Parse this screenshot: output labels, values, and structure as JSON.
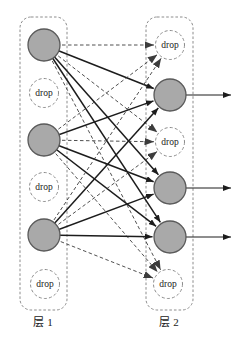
{
  "diagram": {
    "type": "neural-network-dropout-figure",
    "canvas": {
      "width": 238,
      "height": 344,
      "background": "#ffffff"
    },
    "colors": {
      "active_fill": "#a9a9a9",
      "active_stroke": "#5a5a5a",
      "drop_fill": "#ffffff",
      "drop_stroke": "#8c8c8c",
      "panel_stroke": "#8c8c8c",
      "edge_solid": "#1c1c1c",
      "edge_dashed": "#3c3c3c",
      "output_arrow": "#1c1c1c",
      "text": "#1a1a1a"
    },
    "drop_label": "drop",
    "layers": [
      {
        "id": "layer1",
        "label": "层 1",
        "label_pos": {
          "x": 43,
          "y": 326
        },
        "box": {
          "x": 20,
          "y": 17,
          "w": 47,
          "h": 293,
          "r": 11
        },
        "nodes": [
          {
            "id": "L1",
            "kind": "active",
            "cx": 44,
            "cy": 45,
            "r": 16
          },
          {
            "id": "L2",
            "kind": "drop",
            "cx": 44,
            "cy": 93,
            "r": 14.5
          },
          {
            "id": "L3",
            "kind": "active",
            "cx": 44,
            "cy": 140,
            "r": 16
          },
          {
            "id": "L4",
            "kind": "drop",
            "cx": 44,
            "cy": 187,
            "r": 14.5
          },
          {
            "id": "L5",
            "kind": "active",
            "cx": 44,
            "cy": 235,
            "r": 16
          },
          {
            "id": "L6",
            "kind": "drop",
            "cx": 45,
            "cy": 284,
            "r": 14.5
          }
        ]
      },
      {
        "id": "layer2",
        "label": "层 2",
        "label_pos": {
          "x": 169,
          "y": 326
        },
        "box": {
          "x": 146,
          "y": 17,
          "w": 47,
          "h": 293,
          "r": 11
        },
        "nodes": [
          {
            "id": "R1",
            "kind": "drop",
            "cx": 170,
            "cy": 45,
            "r": 14.5
          },
          {
            "id": "R2",
            "kind": "active",
            "cx": 170,
            "cy": 95,
            "r": 16
          },
          {
            "id": "R3",
            "kind": "drop",
            "cx": 170,
            "cy": 142,
            "r": 14.5
          },
          {
            "id": "R4",
            "kind": "active",
            "cx": 170,
            "cy": 188,
            "r": 16
          },
          {
            "id": "R5",
            "kind": "active",
            "cx": 170,
            "cy": 237,
            "r": 16
          },
          {
            "id": "R6",
            "kind": "drop",
            "cx": 168,
            "cy": 284,
            "r": 14.5
          }
        ]
      }
    ],
    "edges": [
      {
        "from": "L1",
        "to": "R1",
        "style": "dashed"
      },
      {
        "from": "L1",
        "to": "R2",
        "style": "solid"
      },
      {
        "from": "L1",
        "to": "R3",
        "style": "dashed"
      },
      {
        "from": "L1",
        "to": "R4",
        "style": "solid"
      },
      {
        "from": "L1",
        "to": "R5",
        "style": "solid"
      },
      {
        "from": "L1",
        "to": "R6",
        "style": "dashed"
      },
      {
        "from": "L3",
        "to": "R1",
        "style": "dashed"
      },
      {
        "from": "L3",
        "to": "R2",
        "style": "solid"
      },
      {
        "from": "L3",
        "to": "R3",
        "style": "dashed"
      },
      {
        "from": "L3",
        "to": "R4",
        "style": "solid"
      },
      {
        "from": "L3",
        "to": "R5",
        "style": "solid"
      },
      {
        "from": "L3",
        "to": "R6",
        "style": "dashed"
      },
      {
        "from": "L5",
        "to": "R1",
        "style": "dashed"
      },
      {
        "from": "L5",
        "to": "R2",
        "style": "solid"
      },
      {
        "from": "L5",
        "to": "R3",
        "style": "dashed"
      },
      {
        "from": "L5",
        "to": "R4",
        "style": "solid"
      },
      {
        "from": "L5",
        "to": "R5",
        "style": "solid"
      },
      {
        "from": "L5",
        "to": "R6",
        "style": "dashed"
      }
    ],
    "output_arrows": [
      {
        "from": "R2",
        "x_end": 231
      },
      {
        "from": "R4",
        "x_end": 231
      },
      {
        "from": "R5",
        "x_end": 231
      }
    ]
  }
}
